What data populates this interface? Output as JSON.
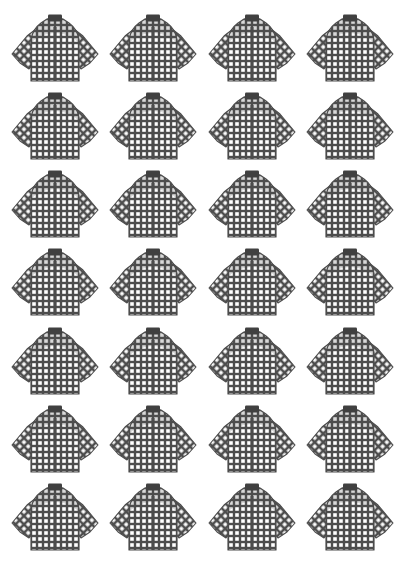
{
  "page": {
    "background_color": "#ffffff",
    "width": 405,
    "height": 571
  },
  "artwork": {
    "subject": "plaid long-sleeve shirt",
    "icon_name": "shirt-icon",
    "repeat_count": 28,
    "columns": 4,
    "rows": 7,
    "ink_color": "#4d4d4d",
    "collar_color": "#404040",
    "pattern_body": "fine checkered plaid grid",
    "pattern_sleeve": "diagonal dot lattice",
    "outline_color": "#4d4d4d"
  },
  "shirts": [
    {
      "index": 1,
      "row": 1,
      "col": 1,
      "label": "shirt-1"
    },
    {
      "index": 2,
      "row": 1,
      "col": 2,
      "label": "shirt-2"
    },
    {
      "index": 3,
      "row": 1,
      "col": 3,
      "label": "shirt-3"
    },
    {
      "index": 4,
      "row": 1,
      "col": 4,
      "label": "shirt-4"
    },
    {
      "index": 5,
      "row": 2,
      "col": 1,
      "label": "shirt-5"
    },
    {
      "index": 6,
      "row": 2,
      "col": 2,
      "label": "shirt-6"
    },
    {
      "index": 7,
      "row": 2,
      "col": 3,
      "label": "shirt-7"
    },
    {
      "index": 8,
      "row": 2,
      "col": 4,
      "label": "shirt-8"
    },
    {
      "index": 9,
      "row": 3,
      "col": 1,
      "label": "shirt-9"
    },
    {
      "index": 10,
      "row": 3,
      "col": 2,
      "label": "shirt-10"
    },
    {
      "index": 11,
      "row": 3,
      "col": 3,
      "label": "shirt-11"
    },
    {
      "index": 12,
      "row": 3,
      "col": 4,
      "label": "shirt-12"
    },
    {
      "index": 13,
      "row": 4,
      "col": 1,
      "label": "shirt-13"
    },
    {
      "index": 14,
      "row": 4,
      "col": 2,
      "label": "shirt-14"
    },
    {
      "index": 15,
      "row": 4,
      "col": 3,
      "label": "shirt-15"
    },
    {
      "index": 16,
      "row": 4,
      "col": 4,
      "label": "shirt-16"
    },
    {
      "index": 17,
      "row": 5,
      "col": 1,
      "label": "shirt-17"
    },
    {
      "index": 18,
      "row": 5,
      "col": 2,
      "label": "shirt-18"
    },
    {
      "index": 19,
      "row": 5,
      "col": 3,
      "label": "shirt-19"
    },
    {
      "index": 20,
      "row": 5,
      "col": 4,
      "label": "shirt-20"
    },
    {
      "index": 21,
      "row": 6,
      "col": 1,
      "label": "shirt-21"
    },
    {
      "index": 22,
      "row": 6,
      "col": 2,
      "label": "shirt-22"
    },
    {
      "index": 23,
      "row": 6,
      "col": 3,
      "label": "shirt-23"
    },
    {
      "index": 24,
      "row": 6,
      "col": 4,
      "label": "shirt-24"
    },
    {
      "index": 25,
      "row": 7,
      "col": 1,
      "label": "shirt-25"
    },
    {
      "index": 26,
      "row": 7,
      "col": 2,
      "label": "shirt-26"
    },
    {
      "index": 27,
      "row": 7,
      "col": 3,
      "label": "shirt-27"
    },
    {
      "index": 28,
      "row": 7,
      "col": 4,
      "label": "shirt-28"
    }
  ]
}
